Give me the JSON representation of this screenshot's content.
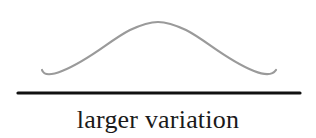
{
  "diagram": {
    "caption": "larger variation",
    "curve": {
      "type": "bell-curve",
      "stroke_color": "#9a9a9a",
      "description": "wide, flat normal distribution curve"
    },
    "baseline": {
      "stroke_color": "#111111"
    }
  }
}
